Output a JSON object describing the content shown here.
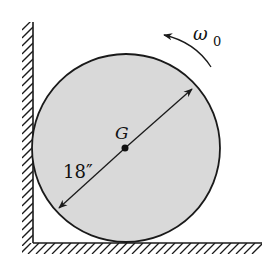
{
  "figure": {
    "labels": {
      "center": "G",
      "diameter": "18″",
      "omega_symbol": "ω",
      "omega_subscript": "0"
    },
    "colors": {
      "disk_fill": "#d9d9d9",
      "line": "#1a1a1a",
      "background": "#ffffff"
    },
    "geometry": {
      "disk_center": [
        126,
        147
      ],
      "disk_radius": 94,
      "wall_x": 33,
      "wall_top_y": 22,
      "floor_y": 243,
      "floor_right_x": 262
    },
    "rotation_direction": "counterclockwise"
  }
}
